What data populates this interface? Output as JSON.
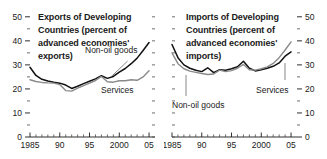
{
  "figure": {
    "background": "#ffffff",
    "series_colors": {
      "non_oil_goods": "#111111",
      "services": "#8a8a8a"
    }
  },
  "chart_data": [
    {
      "panel": "left",
      "type": "line",
      "title": "Exports of Developing Countries (percent of advanced economies' exports)",
      "title_lines": [
        "Exports of Developing",
        "Countries (percent of",
        "advanced economies'",
        "exports)"
      ],
      "xlabel": "",
      "ylabel": "",
      "xlim": [
        1985,
        2006
      ],
      "ylim": [
        0,
        52
      ],
      "yticks": [
        0,
        10,
        20,
        30,
        40,
        50
      ],
      "ytick_labels": [
        "0",
        "10",
        "20",
        "30",
        "40",
        "50"
      ],
      "y_minor_ticks": [
        5,
        15,
        25,
        35,
        45
      ],
      "y_axis_side": "left",
      "xticks": [
        1985,
        1990,
        1995,
        2000,
        2005
      ],
      "xtick_labels": [
        "1985",
        "90",
        "95",
        "2000",
        "05"
      ],
      "grid": false,
      "legend_position": "inline-annotations",
      "annotations": [
        {
          "text": "Non-oil goods",
          "x": 1996.0,
          "y": 35.0
        },
        {
          "text": "Services",
          "x": 1999.0,
          "y": 21.0
        }
      ],
      "x": [
        1985,
        1986,
        1987,
        1988,
        1989,
        1990,
        1991,
        1992,
        1993,
        1994,
        1995,
        1996,
        1997,
        1998,
        1999,
        2000,
        2001,
        2002,
        2003,
        2004,
        2005
      ],
      "series": [
        {
          "name": "Non-oil goods",
          "color": "#111111",
          "values": [
            29.0,
            25.6,
            24.0,
            23.3,
            22.8,
            22.4,
            21.6,
            20.2,
            21.1,
            22.2,
            23.2,
            24.2,
            25.5,
            24.4,
            25.2,
            27.0,
            28.5,
            30.5,
            32.8,
            36.0,
            39.3
          ]
        },
        {
          "name": "Services",
          "color": "#8a8a8a",
          "values": [
            23.8,
            23.1,
            22.7,
            22.5,
            22.4,
            21.8,
            19.3,
            19.1,
            20.3,
            21.4,
            22.4,
            23.5,
            25.2,
            23.0,
            22.8,
            23.4,
            23.4,
            23.8,
            23.6,
            25.0,
            27.6
          ]
        }
      ]
    },
    {
      "panel": "right",
      "type": "line",
      "title": "Imports of Developing Countries (percent of advanced economies' imports)",
      "title_lines": [
        "Imports of Developing",
        "Countries (percent of",
        "advanced economies'",
        "imports)"
      ],
      "xlabel": "",
      "ylabel": "",
      "xlim": [
        1985,
        2006
      ],
      "ylim": [
        0,
        52
      ],
      "yticks": [
        0,
        10,
        20,
        30,
        40,
        50
      ],
      "ytick_labels": [
        "0",
        "10",
        "20",
        "30",
        "40",
        "50"
      ],
      "y_minor_ticks": [
        5,
        15,
        25,
        35,
        45
      ],
      "y_axis_side": "right",
      "xticks": [
        1985,
        1990,
        1995,
        2000,
        2005
      ],
      "xtick_labels": [
        "1985",
        "90",
        "95",
        "2000",
        "05"
      ],
      "grid": false,
      "legend_position": "inline-annotations",
      "annotations": [
        {
          "text": "Non-oil goods",
          "x": 1987.0,
          "y": 14.5
        },
        {
          "text": "Services",
          "x": 2002.0,
          "y": 21.0
        }
      ],
      "x": [
        1985,
        1986,
        1987,
        1988,
        1989,
        1990,
        1991,
        1992,
        1993,
        1994,
        1995,
        1996,
        1997,
        1998,
        1999,
        2000,
        2001,
        2002,
        2003,
        2004,
        2005
      ],
      "series": [
        {
          "name": "Non-oil goods",
          "color": "#111111",
          "values": [
            38.5,
            33.0,
            30.0,
            28.6,
            27.8,
            27.2,
            28.8,
            26.8,
            28.0,
            27.8,
            28.4,
            29.2,
            31.5,
            28.6,
            27.5,
            28.0,
            28.6,
            29.4,
            30.8,
            33.6,
            35.4
          ]
        },
        {
          "name": "Services",
          "color": "#8a8a8a",
          "values": [
            35.0,
            30.5,
            28.4,
            27.4,
            26.9,
            26.4,
            26.0,
            26.2,
            27.8,
            27.2,
            27.6,
            28.6,
            30.2,
            28.0,
            27.8,
            28.4,
            29.2,
            30.6,
            33.0,
            36.2,
            39.6
          ]
        }
      ]
    }
  ]
}
